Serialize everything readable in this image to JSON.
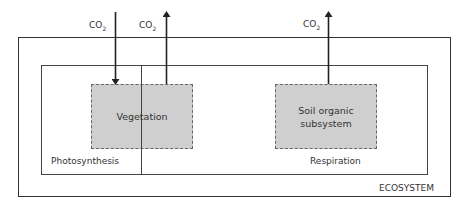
{
  "diagram": {
    "boxes": {
      "ecosystem": {
        "label": "ECOSYSTEM"
      },
      "vegetation": {
        "label": "Vegetation"
      },
      "soil": {
        "label_line1": "Soil organic",
        "label_line2": "subsystem"
      }
    },
    "regions": {
      "left": "Photosynthesis",
      "right": "Respiration"
    },
    "flows": [
      {
        "label": "CO",
        "subscript": "2",
        "direction": "in",
        "target": "Vegetation"
      },
      {
        "label": "CO",
        "subscript": "2",
        "direction": "out",
        "source": "Vegetation"
      },
      {
        "label": "CO",
        "subscript": "2",
        "direction": "out",
        "source": "Soil organic subsystem"
      }
    ],
    "colors": {
      "stroke": "#333333",
      "fill": "#cfcfcf",
      "dash": "#666666"
    }
  }
}
